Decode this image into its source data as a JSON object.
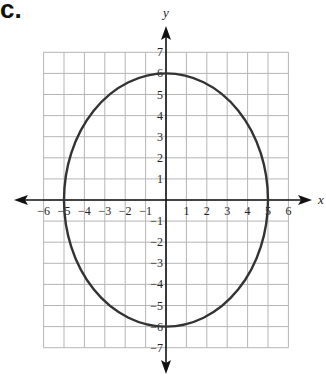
{
  "problem": {
    "label": "c."
  },
  "chart_data": {
    "type": "line",
    "title": "",
    "xlabel": "x",
    "ylabel": "y",
    "xlim": [
      -6,
      6
    ],
    "ylim": [
      -7,
      7
    ],
    "grid": true,
    "x_tick_labels": [
      "-6",
      "-5",
      "-4",
      "-3",
      "-2",
      "-1",
      "1",
      "2",
      "3",
      "4",
      "5",
      "6"
    ],
    "y_tick_labels": [
      "7",
      "6",
      "5",
      "4",
      "3",
      "2",
      "1",
      "-1",
      "-2",
      "-3",
      "-4",
      "-5",
      "-6",
      "-7"
    ],
    "series": [
      {
        "name": "ellipse",
        "shape": "ellipse",
        "equation": "x^2/25 + y^2/36 = 1",
        "center": [
          0,
          0
        ],
        "semi_axis_x": 5,
        "semi_axis_y": 6,
        "key_points": [
          [
            5,
            0
          ],
          [
            -5,
            0
          ],
          [
            0,
            6
          ],
          [
            0,
            -6
          ]
        ]
      }
    ],
    "legend": null
  },
  "colors": {
    "grid": "#b5b5b5",
    "axis": "#111111",
    "curve": "#333333"
  }
}
